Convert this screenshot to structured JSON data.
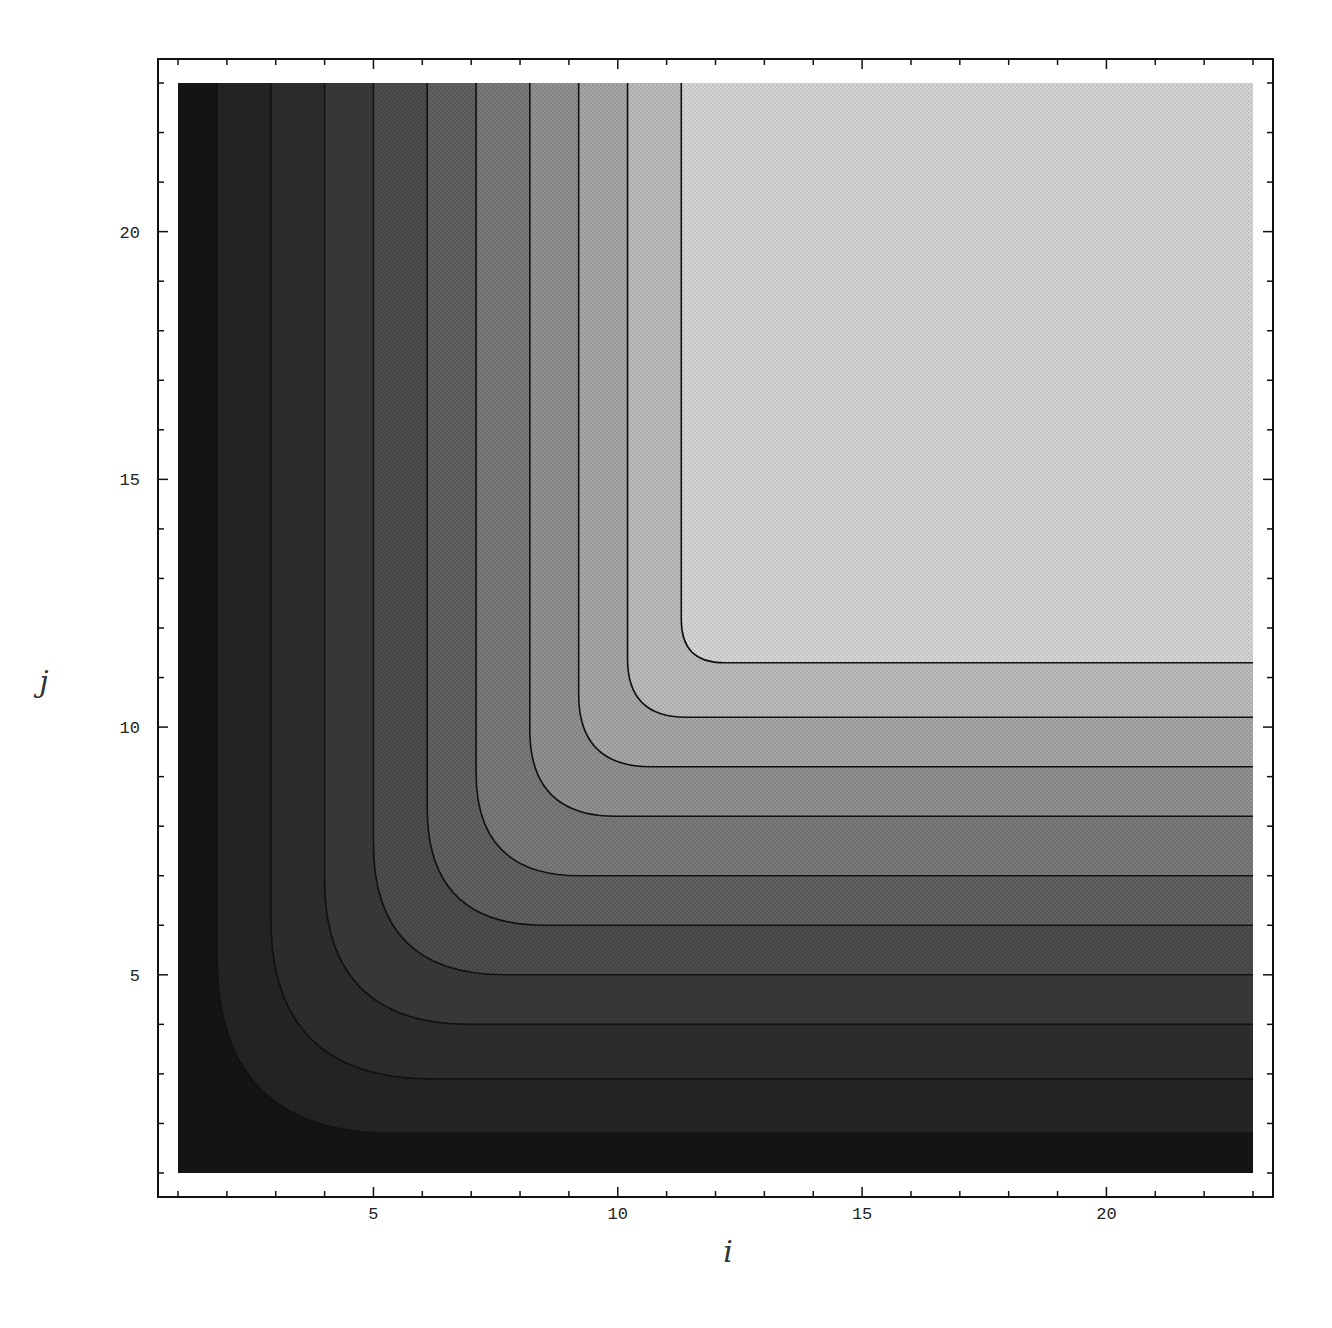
{
  "chart_data": {
    "type": "contour",
    "title": "",
    "xlabel": "i",
    "ylabel": "j",
    "xlim": [
      0.6,
      23.4
    ],
    "ylim": [
      0.6,
      23.4
    ],
    "data_extent": {
      "i": [
        1,
        23
      ],
      "j": [
        1,
        23
      ]
    },
    "grid": false,
    "legend": null,
    "colormap": "grayscale (dark at low i/j, light at high i and j)",
    "x_ticks": [
      5,
      10,
      15,
      20
    ],
    "y_ticks": [
      5,
      10,
      15,
      20
    ],
    "x_tick_labels": [
      "5",
      "10",
      "15",
      "20"
    ],
    "y_tick_labels": [
      "5",
      "10",
      "15",
      "20"
    ],
    "contour_levels": [
      {
        "level": 1,
        "i_asymptote": 1.8,
        "j_asymptote": 1.8,
        "fill_below": "#151515"
      },
      {
        "level": 2,
        "i_asymptote": 2.9,
        "j_asymptote": 2.9,
        "fill_below": "#252525"
      },
      {
        "level": 3,
        "i_asymptote": 4.0,
        "j_asymptote": 4.0,
        "fill_below": "#2e2e2e"
      },
      {
        "level": 4,
        "i_asymptote": 5.0,
        "j_asymptote": 5.0,
        "fill_below": "#3a3a3a"
      },
      {
        "level": 5,
        "i_asymptote": 6.1,
        "j_asymptote": 6.0,
        "fill_below": "#4d4d4d"
      },
      {
        "level": 6,
        "i_asymptote": 7.1,
        "j_asymptote": 7.0,
        "fill_below": "#626262"
      },
      {
        "level": 7,
        "i_asymptote": 8.2,
        "j_asymptote": 8.2,
        "fill_below": "#7a7a7a"
      },
      {
        "level": 8,
        "i_asymptote": 9.2,
        "j_asymptote": 9.2,
        "fill_below": "#929292"
      },
      {
        "level": 9,
        "i_asymptote": 10.2,
        "j_asymptote": 10.2,
        "fill_below": "#a8a8a8"
      },
      {
        "level": 10,
        "i_asymptote": 11.3,
        "j_asymptote": 11.3,
        "fill_below": "#bdbdbd"
      }
    ],
    "top_region_fill": "#d8d8d8"
  },
  "axes": {
    "x_label": "i",
    "y_label": "j",
    "x_ticks": [
      "5",
      "10",
      "15",
      "20"
    ],
    "y_ticks": [
      "5",
      "10",
      "15",
      "20"
    ]
  }
}
